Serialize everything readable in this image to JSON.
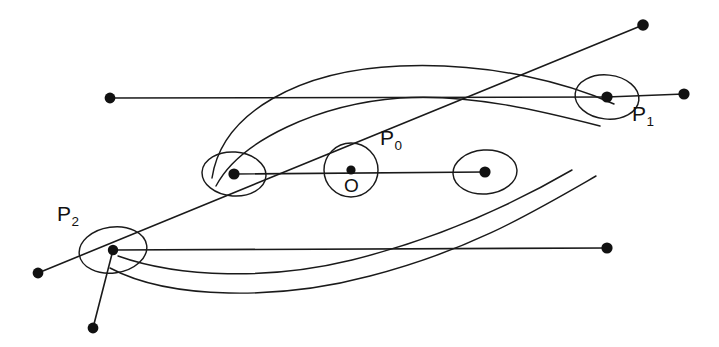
{
  "figure": {
    "background_color": "#ffffff",
    "ink_color": "#111111",
    "width": 719,
    "height": 347
  },
  "labels": {
    "p0": {
      "base": "P",
      "sub": "0",
      "x": 380,
      "y": 127
    },
    "p1": {
      "base": "P",
      "sub": "1",
      "x": 632,
      "y": 103
    },
    "p2": {
      "base": "P",
      "sub": "2",
      "x": 57,
      "y": 203
    },
    "origin": {
      "text": "O",
      "x": 344,
      "y": 176
    }
  },
  "nodes": [
    {
      "name": "node-p2",
      "x": 113,
      "y": 250,
      "r": 5.2
    },
    {
      "name": "node-left-middle",
      "x": 234,
      "y": 174,
      "r": 5.6
    },
    {
      "name": "node-origin",
      "x": 351,
      "y": 170,
      "r": 4.6
    },
    {
      "name": "node-right-middle",
      "x": 485,
      "y": 172,
      "r": 5.6
    },
    {
      "name": "node-p1",
      "x": 607,
      "y": 97,
      "r": 5.6
    }
  ],
  "endpoints": [
    {
      "name": "endpoint-upper-left",
      "x": 110,
      "y": 98,
      "r": 5.4
    },
    {
      "name": "endpoint-top-right",
      "x": 643,
      "y": 25,
      "r": 5.8
    },
    {
      "name": "endpoint-right",
      "x": 684,
      "y": 94,
      "r": 5.6
    },
    {
      "name": "endpoint-lower-right",
      "x": 607,
      "y": 248,
      "r": 5.6
    },
    {
      "name": "endpoint-left",
      "x": 38,
      "y": 273,
      "r": 5.4
    },
    {
      "name": "endpoint-bottom",
      "x": 93,
      "y": 328,
      "r": 5.4
    }
  ],
  "edges": [
    {
      "name": "edge-upper-left-to-p1",
      "x1": 110,
      "y1": 98,
      "x2": 607,
      "y2": 97
    },
    {
      "name": "edge-left-to-top-right",
      "x1": 38,
      "y1": 273,
      "x2": 643,
      "y2": 25
    },
    {
      "name": "edge-p2-to-lower-right",
      "x1": 113,
      "y1": 250,
      "x2": 607,
      "y2": 248
    },
    {
      "name": "edge-p1-to-right",
      "x1": 607,
      "y1": 97,
      "x2": 684,
      "y2": 94
    },
    {
      "name": "edge-p2-to-bottom",
      "x1": 113,
      "y1": 250,
      "x2": 93,
      "y2": 328
    },
    {
      "name": "edge-axis-left-to-right",
      "x1": 234,
      "y1": 174,
      "x2": 485,
      "y2": 172
    }
  ],
  "circles": {
    "origin_circle": {
      "name": "circle-origin",
      "cx": 351,
      "cy": 170,
      "r": 27
    }
  },
  "curves": {
    "outer_upper": "M 212,178 C 222,112 300,70 400,66 C 492,62 570,84 614,104",
    "outer_lower": "M 110,268 C 170,300 280,300 370,276 C 470,250 530,214 596,176",
    "inner_upper": "M 216,186 C 240,140 320,104 400,98 C 470,93 545,112 600,126",
    "inner_lower": "M 118,256 C 180,278 270,280 352,260 C 440,238 510,206 572,170"
  },
  "loops": [
    {
      "name": "loop-p2",
      "cx": 113,
      "cy": 250,
      "rx": 34,
      "ry": 23,
      "rot": -8
    },
    {
      "name": "loop-left-middle",
      "cx": 234,
      "cy": 174,
      "rx": 32,
      "ry": 22,
      "rot": 4
    },
    {
      "name": "loop-right-middle",
      "cx": 485,
      "cy": 172,
      "rx": 32,
      "ry": 22,
      "rot": -4
    },
    {
      "name": "loop-p1",
      "cx": 607,
      "cy": 97,
      "rx": 32,
      "ry": 22,
      "rot": 6
    }
  ]
}
